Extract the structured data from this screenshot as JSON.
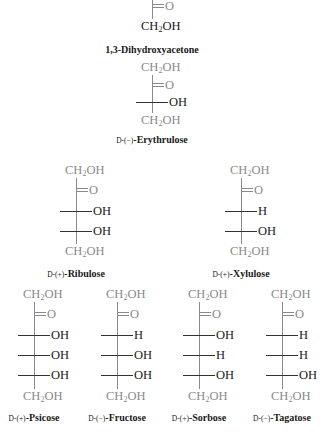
{
  "structures": [
    {
      "name": "1,3-Dihydroxyacetone",
      "prefix": "",
      "rotation": "",
      "label": "1,3-Dihydroxyacetone",
      "top": "",
      "carbonyl": "O",
      "rows": [],
      "bottom": "CH2OH"
    },
    {
      "name": "D-(-)-Erythrulose",
      "prefix": "D",
      "rotation": "(−)",
      "label": "Erythrulose",
      "top": "CH2OH",
      "carbonyl": "O",
      "rows": [
        {
          "left": "H",
          "right": "OH"
        }
      ],
      "bottom": "CH2OH"
    },
    {
      "name": "D-(+)-Ribulose",
      "prefix": "D",
      "rotation": "(+)",
      "label": "Ribulose",
      "top": "CH2OH",
      "carbonyl": "O",
      "rows": [
        {
          "left": "H",
          "right": "OH"
        },
        {
          "left": "H",
          "right": "OH"
        }
      ],
      "bottom": "CH2OH"
    },
    {
      "name": "D-(+)-Xylulose",
      "prefix": "D",
      "rotation": "(+)",
      "label": "Xylulose",
      "top": "CH2OH",
      "carbonyl": "O",
      "rows": [
        {
          "left": "HO",
          "right": "H"
        },
        {
          "left": "H",
          "right": "OH"
        }
      ],
      "bottom": "CH2OH"
    },
    {
      "name": "D-(+)-Psicose",
      "prefix": "D",
      "rotation": "(+)",
      "label": "Psicose",
      "top": "CH2OH",
      "carbonyl": "O",
      "rows": [
        {
          "left": "H",
          "right": "OH"
        },
        {
          "left": "H",
          "right": "OH"
        },
        {
          "left": "H",
          "right": "OH"
        }
      ],
      "bottom": "CH2OH"
    },
    {
      "name": "D-(-)-Fructose",
      "prefix": "D",
      "rotation": "(−)",
      "label": "Fructose",
      "top": "CH2OH",
      "carbonyl": "O",
      "rows": [
        {
          "left": "HO",
          "right": "H"
        },
        {
          "left": "H",
          "right": "OH"
        },
        {
          "left": "H",
          "right": "OH"
        }
      ],
      "bottom": "CH2OH"
    },
    {
      "name": "D-(+)-Sorbose",
      "prefix": "D",
      "rotation": "(+)",
      "label": "Sorbose",
      "top": "CH2OH",
      "carbonyl": "O",
      "rows": [
        {
          "left": "H",
          "right": "OH"
        },
        {
          "left": "HO",
          "right": "H"
        },
        {
          "left": "H",
          "right": "OH"
        }
      ],
      "bottom": "CH2OH"
    },
    {
      "name": "D-(-)-Tagatose",
      "prefix": "D",
      "rotation": "(−)",
      "label": "Tagatose",
      "top": "CH2OH",
      "carbonyl": "O",
      "rows": [
        {
          "left": "HO",
          "right": "H"
        },
        {
          "left": "HO",
          "right": "H"
        },
        {
          "left": "H",
          "right": "OH"
        }
      ],
      "bottom": "CH2OH"
    }
  ],
  "colors": {
    "new_carbons": "#1a1a1a",
    "inherited_carbons": "#8a8a8a",
    "background": "#ffffff"
  }
}
